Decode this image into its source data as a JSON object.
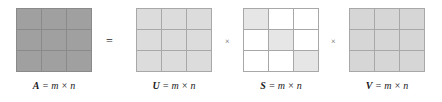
{
  "diagram": {
    "equation_operators": {
      "equals": "=",
      "times_1": "×",
      "times_2": "×"
    },
    "matrices": [
      {
        "id": "A",
        "name": "A",
        "label": "A = m × n",
        "dimension_text": "= m × n",
        "rows": 3,
        "cols": 3,
        "fill": "#a0a0a0",
        "grid_line_color": "#8a8a8a",
        "pattern": "uniform",
        "cells": [
          [
            "on",
            "on",
            "on"
          ],
          [
            "on",
            "on",
            "on"
          ],
          [
            "on",
            "on",
            "on"
          ]
        ]
      },
      {
        "id": "U",
        "name": "U",
        "label": "U = m × n",
        "dimension_text": "= m × n",
        "rows": 3,
        "cols": 3,
        "fill": "#dcdcdc",
        "grid_line_color": "#a8a8a8",
        "pattern": "uniform",
        "cells": [
          [
            "on",
            "on",
            "on"
          ],
          [
            "on",
            "on",
            "on"
          ],
          [
            "on",
            "on",
            "on"
          ]
        ]
      },
      {
        "id": "S",
        "name": "S",
        "label": "S = m × n",
        "dimension_text": "= m × n",
        "rows": 3,
        "cols": 3,
        "fill": "#e6e6e6",
        "empty_fill": "#ffffff",
        "grid_line_color": "#a8a8a8",
        "pattern": "diagonal",
        "cells": [
          [
            "on",
            "off",
            "off"
          ],
          [
            "off",
            "on",
            "off"
          ],
          [
            "off",
            "off",
            "on"
          ]
        ]
      },
      {
        "id": "V",
        "name": "V",
        "label": "V = m × n",
        "dimension_text": "= m × n",
        "rows": 3,
        "cols": 3,
        "fill": "#d6d6d6",
        "grid_line_color": "#a8a8a8",
        "pattern": "uniform",
        "cells": [
          [
            "on",
            "on",
            "on"
          ],
          [
            "on",
            "on",
            "on"
          ],
          [
            "on",
            "on",
            "on"
          ]
        ]
      }
    ]
  }
}
